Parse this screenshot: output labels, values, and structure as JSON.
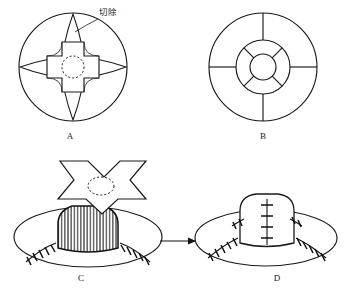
{
  "figure": {
    "background_color": "#ffffff",
    "ink_color": "#1a1a1a",
    "panels": [
      {
        "id": "A",
        "label": "A",
        "caption": "切除",
        "caption_meaning": "resection",
        "description": "Circle with central cross-shaped flap outline, four hatched lens-shaped excision petals, dashed central circle"
      },
      {
        "id": "B",
        "label": "B",
        "description": "Concentric circles with four radial spokes and inner rosette"
      },
      {
        "id": "C",
        "label": "C",
        "description": "Cross-shaped flap raised above ellipse with vertically hatched dome and suture marks"
      },
      {
        "id": "D",
        "label": "D",
        "description": "Final closed dome on ellipse with vertical suture line and radiating stitch marks"
      }
    ],
    "annotations": {
      "resection_label": "切除",
      "arrow_symbol": "→"
    },
    "labels": {
      "a": "A",
      "b": "B",
      "c": "C",
      "d": "D"
    }
  }
}
